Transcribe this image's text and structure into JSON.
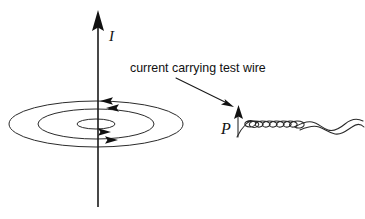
{
  "figure": {
    "background_color": "#ffffff",
    "ink_color": "#111111",
    "width": 365,
    "height": 219
  },
  "labels": {
    "current_label": "I",
    "point_label": "P",
    "caption": "current carrying test wire"
  },
  "current_axis": {
    "name": "current-arrow",
    "x": 98,
    "top_y": 11,
    "bottom_y": 207,
    "direction": "up",
    "label": "I",
    "label_x": 110,
    "label_y": 40
  },
  "field_lines": {
    "center_x": 96,
    "center_y": 124,
    "ellipses": [
      {
        "rx": 87,
        "ry": 23
      },
      {
        "rx": 58,
        "ry": 15
      },
      {
        "rx": 19,
        "ry": 5
      }
    ],
    "arrows": [
      {
        "x": 110,
        "y": 101,
        "direction": "left"
      },
      {
        "x": 116,
        "y": 108,
        "direction": "left"
      },
      {
        "x": 108,
        "y": 132,
        "direction": "right"
      },
      {
        "x": 115,
        "y": 140,
        "direction": "right"
      }
    ]
  },
  "caption_block": {
    "text": "current carrying test wire",
    "x": 130,
    "y": 72,
    "leader_from": {
      "x": 176,
      "y": 78
    },
    "leader_to": {
      "x": 232,
      "y": 107
    }
  },
  "test_wire": {
    "point_label": "P",
    "point_label_x": 222,
    "point_label_y": 133,
    "arrow_x": 238,
    "arrow_top_y": 106,
    "arrow_bottom_y": 136,
    "helix_start_x": 238,
    "helix_end_x": 362,
    "axis_y": 126,
    "description": "helical coiled wire drawn nearly edge on, flattening to a wave at the right"
  }
}
